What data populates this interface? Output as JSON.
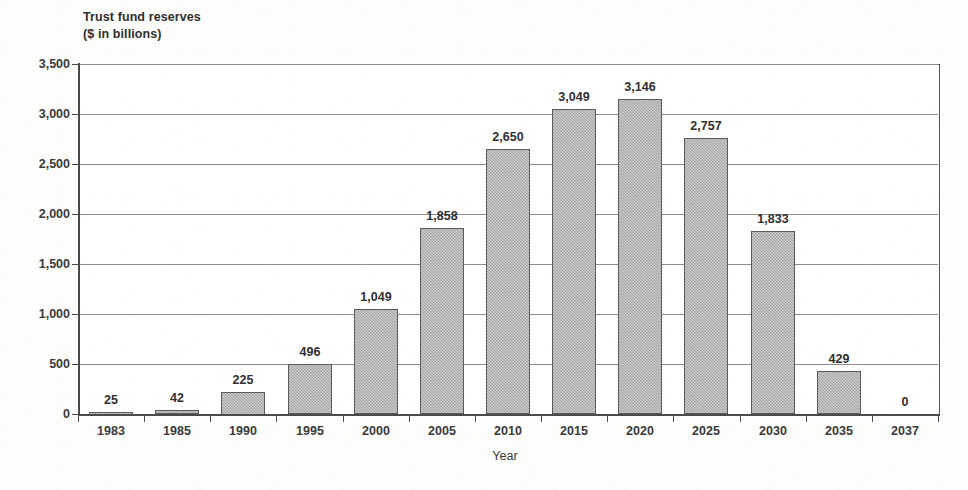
{
  "chart_data": {
    "type": "bar",
    "title": "Trust fund reserves\n($ in billions)",
    "title_line1": "Trust fund reserves",
    "title_line2": "($ in billions)",
    "xlabel": "Year",
    "ylabel": "",
    "categories": [
      "1983",
      "1985",
      "1990",
      "1995",
      "2000",
      "2005",
      "2010",
      "2015",
      "2020",
      "2025",
      "2030",
      "2035",
      "2037"
    ],
    "values": [
      25,
      42,
      225,
      496,
      1049,
      1858,
      2650,
      3049,
      3146,
      2757,
      1833,
      429,
      0
    ],
    "value_labels": [
      "25",
      "42",
      "225",
      "496",
      "1,049",
      "1,858",
      "2,650",
      "3,049",
      "3,146",
      "2,757",
      "1,833",
      "429",
      "0"
    ],
    "ylim": [
      0,
      3500
    ],
    "ytick_values": [
      0,
      500,
      1000,
      1500,
      2000,
      2500,
      3000,
      3500
    ],
    "ytick_labels": [
      "0",
      "500",
      "1,000",
      "1,500",
      "2,000",
      "2,500",
      "3,000",
      "3,500"
    ],
    "grid": true,
    "legend": false,
    "legend_position": "none",
    "series_color": "#a8a8a8",
    "bar_border_color": "#5a5a5a",
    "axis_color": "#4a4a4a",
    "gridline_color": "#8c8c8c",
    "background_color": "#fdfdfb",
    "plot_background_color": "#ffffff"
  }
}
